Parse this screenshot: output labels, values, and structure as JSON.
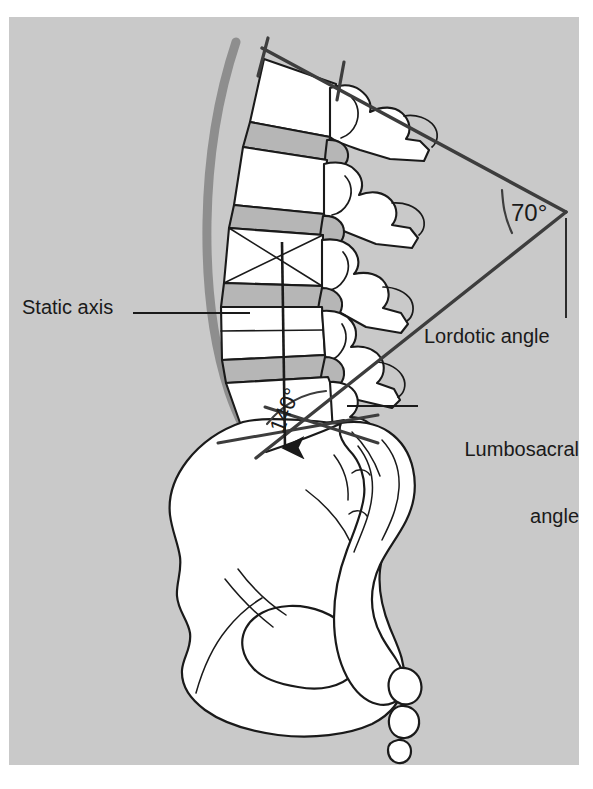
{
  "figure": {
    "kind": "anatomical-illustration",
    "background_color": "#c9c9c9",
    "page_color": "#ffffff",
    "bone_fill": "#ffffff",
    "disc_fill": "#b6b6b6",
    "outline_color": "#1a1a1a",
    "reference_line_color": "#4a4a4a",
    "shadow_color": "#8f8f8f"
  },
  "labels": {
    "static_axis": "Static axis",
    "lordotic_angle": "Lordotic angle",
    "lumbosacral_angle_line1": "Lumbosacral",
    "lumbosacral_angle_line2": "angle"
  },
  "measurements": {
    "lordotic_angle_value": "70°",
    "lumbosacral_angle_value": "140°"
  },
  "annotations": {
    "leader_static_axis": "horizontal leader from 'Static axis' text to L4 vertebral body",
    "leader_lordotic": "vertical leader from 70° vertex down to 'Lordotic angle' text",
    "leader_lumbosacral": "horizontal leader from sacral promontory to 'Lumbosacral angle' text",
    "static_axis_arrow": "vertical arrow with arrowhead descending from L3 through L5 to sacral endplate"
  }
}
